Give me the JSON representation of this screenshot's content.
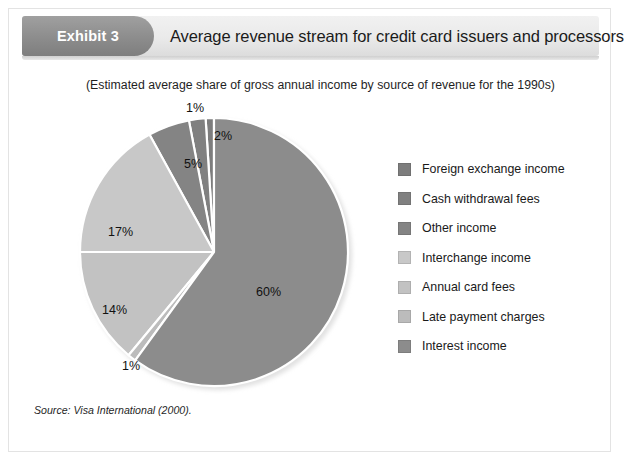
{
  "header": {
    "badge_label": "Exhibit 3",
    "title": "Average revenue stream for credit card issuers and processors"
  },
  "subtitle": "(Estimated average share of gross annual income by source of revenue for the 1990s)",
  "source": {
    "prefix": "Source:",
    "text": "Visa International (2000)."
  },
  "colors": {
    "badge": "#8e8e8e",
    "header_band": "#eaeaea",
    "frame_border": "#e3e3e3",
    "slice_dark": "#7d7d7d",
    "slice_medium": "#8c8c8c",
    "slice_light": "#bdbdbd",
    "slice_lighter": "#c6c6c6",
    "separator": "#ffffff"
  },
  "chart_data": {
    "type": "pie",
    "title": "Average revenue stream for credit card issuers and processors",
    "subtitle": "(Estimated average share of gross annual income by source of revenue for the 1990s)",
    "categories": [
      "Foreign exchange income",
      "Cash withdrawal fees",
      "Other income",
      "Interchange income",
      "Annual card fees",
      "Late payment charges",
      "Interest income"
    ],
    "values": [
      1,
      2,
      5,
      17,
      14,
      1,
      60
    ],
    "value_labels": [
      "1%",
      "2%",
      "5%",
      "17%",
      "14%",
      "1%",
      "60%"
    ],
    "units": "percent",
    "slice_colors": [
      "#7d7d7d",
      "#808080",
      "#848484",
      "#c8c8c8",
      "#c2c2c2",
      "#bcbcbc",
      "#8c8c8c"
    ],
    "start_angle_deg": 0,
    "direction": "counterclockwise",
    "legend_position": "right",
    "grid": false,
    "legend": [
      {
        "label": "Foreign exchange income",
        "color": "#7d7d7d",
        "value": 1
      },
      {
        "label": "Cash withdrawal fees",
        "color": "#808080",
        "value": 2
      },
      {
        "label": "Other income",
        "color": "#848484",
        "value": 5
      },
      {
        "label": "Interchange income",
        "color": "#c8c8c8",
        "value": 17
      },
      {
        "label": "Annual card fees",
        "color": "#c2c2c2",
        "value": 14
      },
      {
        "label": "Late payment charges",
        "color": "#bcbcbc",
        "value": 1
      },
      {
        "label": "Interest income",
        "color": "#8c8c8c",
        "value": 60
      }
    ]
  }
}
